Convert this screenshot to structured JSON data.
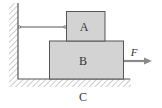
{
  "diagram": {
    "type": "physics-free-body-setup",
    "blocks": [
      {
        "id": "A",
        "label": "A",
        "fill": "#d3d3d3"
      },
      {
        "id": "B",
        "label": "B",
        "fill": "#d3d3d3"
      }
    ],
    "surface_label": "C",
    "force_label": "F",
    "colors": {
      "block_fill": "#d3d3d3",
      "stroke": "#555555",
      "arrow": "#8a8a8a",
      "hatch": "#9a9a9a",
      "text": "#333333"
    }
  }
}
